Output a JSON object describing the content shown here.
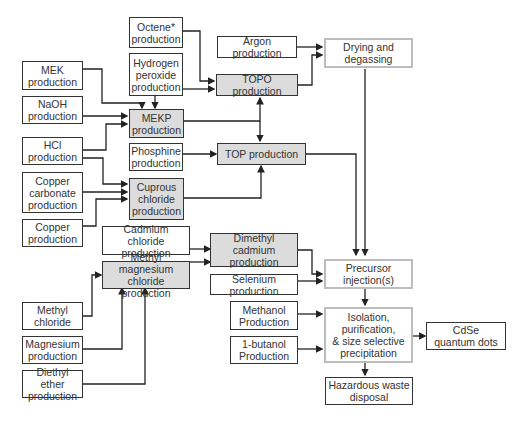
{
  "diagram": {
    "nodes": {
      "octene": "Octene*\nproduction",
      "argon": "Argon production",
      "drying": "Drying and\ndegassing",
      "mek": "MEK\nproduction",
      "h2o2": "Hydrogen\nperoxide\nproduction",
      "topo": "TOPO production",
      "naoh": "NaOH\nproduction",
      "mekp": "MEKP\nproduction",
      "hcl": "HCl\nproduction",
      "phosphine": "Phosphine\nproduction",
      "top": "TOP production",
      "copper_carbonate": "Copper\ncarbonate\nproduction",
      "cuprous": "Cuprous\nchloride\nproduction",
      "copper": "Copper\nproduction",
      "cadmium_chloride": "Cadmium chloride\nproduction",
      "dimethyl_cadmium": "Dimethyl cadmium\nproduction",
      "methyl_mg": "Methyl magnesium\nchloride production",
      "selenium": "Selenium production",
      "precursor": "Precursor\ninjection(s)",
      "methyl_chloride": "Methyl\nchloride",
      "methanol": "Methanol\nProduction",
      "isolation": "Isolation,\npurification,\n& size selective\nprecipitation",
      "cdse": "CdSe\nquantum dots",
      "butanol": "1-butanol\nProduction",
      "magnesium": "Magnesium\nproduction",
      "diethyl_ether": "Diethyl ether\nproduction",
      "waste": "Hazardous waste\ndisposal"
    },
    "edges": [
      [
        "octene",
        "topo"
      ],
      [
        "h2o2",
        "topo"
      ],
      [
        "h2o2",
        "mekp"
      ],
      [
        "mek",
        "mekp"
      ],
      [
        "naoh",
        "mekp"
      ],
      [
        "hcl",
        "mekp"
      ],
      [
        "hcl",
        "cuprous"
      ],
      [
        "copper_carbonate",
        "cuprous"
      ],
      [
        "copper",
        "cuprous"
      ],
      [
        "mekp",
        "topo"
      ],
      [
        "mekp",
        "top"
      ],
      [
        "phosphine",
        "top"
      ],
      [
        "cuprous",
        "top"
      ],
      [
        "argon",
        "drying"
      ],
      [
        "topo",
        "drying"
      ],
      [
        "drying",
        "precursor"
      ],
      [
        "top",
        "precursor"
      ],
      [
        "cadmium_chloride",
        "dimethyl_cadmium"
      ],
      [
        "methyl_mg",
        "dimethyl_cadmium"
      ],
      [
        "methyl_chloride",
        "methyl_mg"
      ],
      [
        "magnesium",
        "methyl_mg"
      ],
      [
        "diethyl_ether",
        "methyl_mg"
      ],
      [
        "dimethyl_cadmium",
        "precursor"
      ],
      [
        "selenium",
        "precursor"
      ],
      [
        "precursor",
        "isolation"
      ],
      [
        "methanol",
        "isolation"
      ],
      [
        "butanol",
        "isolation"
      ],
      [
        "isolation",
        "cdse"
      ],
      [
        "isolation",
        "waste"
      ]
    ]
  }
}
